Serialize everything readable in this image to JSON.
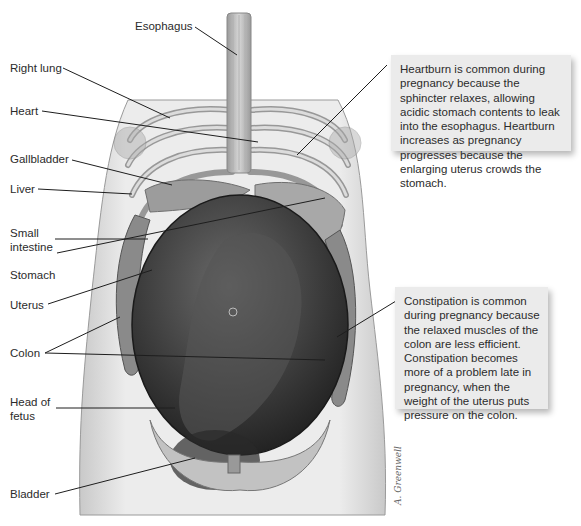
{
  "labels": {
    "esophagus": "Esophagus",
    "right_lung": "Right lung",
    "heart": "Heart",
    "gallbladder": "Gallbladder",
    "liver": "Liver",
    "small_intestine": "Small\nintestine",
    "stomach": "Stomach",
    "uterus": "Uterus",
    "colon": "Colon",
    "head_of_fetus": "Head of\nfetus",
    "bladder": "Bladder"
  },
  "callouts": {
    "heartburn": "Heartburn is common during pregnancy because the sphincter relaxes, allowing acidic stomach contents to leak into the esophagus. Heartburn increases as pregnancy progresses because the enlarging uterus crowds the stomach.",
    "constipation": "Constipation is common during pregnancy because the relaxed muscles of the colon are less efficient. Constipation becomes more of a problem late in pregnancy, when the weight of the uterus puts pressure on the colon."
  },
  "colors": {
    "callout_bg": "#ebebeb",
    "leader_line": "#1e1e1e",
    "skin": "#e4e4e4",
    "uterus_dark": "#3a3a3a"
  },
  "artist_signature": "A. Greenwell"
}
